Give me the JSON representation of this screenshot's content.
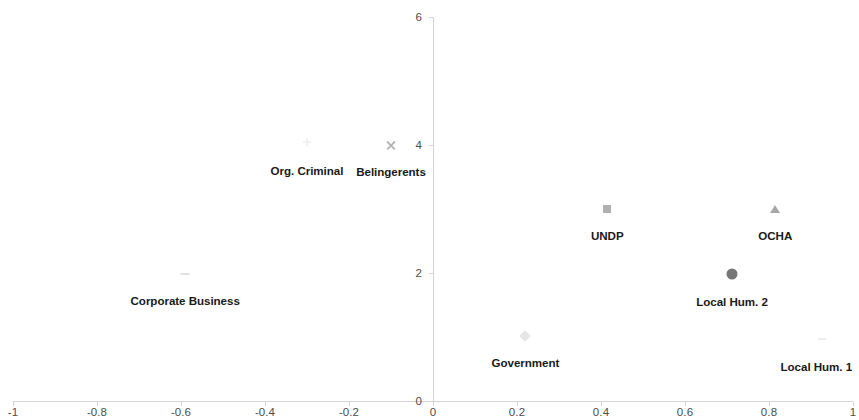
{
  "chart_data": {
    "type": "scatter",
    "title": "",
    "xlabel": "",
    "ylabel": "",
    "xlim": [
      -1,
      1
    ],
    "ylim": [
      0,
      6
    ],
    "grid": false,
    "legend": "none",
    "xticks": [
      "-1",
      "-0.8",
      "-0.6",
      "-0.4",
      "-0.2",
      "0",
      "0.2",
      "0.4",
      "0.6",
      "0.8",
      "1"
    ],
    "xtick_values": [
      -1,
      -0.8,
      -0.6,
      -0.4,
      -0.2,
      0,
      0.2,
      0.4,
      0.6,
      0.8,
      1
    ],
    "yticks": [
      "0",
      "2",
      "4",
      "6"
    ],
    "ytick_values": [
      0,
      2,
      4,
      6
    ],
    "axis_color": "#d4d4d4",
    "tick_label_color": "#4c4c4c",
    "point_label_color": "#1a1a1a",
    "points": [
      {
        "label": "Org. Criminal",
        "x": -0.3,
        "y": 4.05,
        "marker": "plus",
        "color": "#f2f2f2",
        "size": 8,
        "label_dx": 0,
        "label_dy": 22
      },
      {
        "label": "Belingerents",
        "x": -0.1,
        "y": 4.0,
        "marker": "x",
        "color": "#b5b5b5",
        "size": 11,
        "label_dx": 0,
        "label_dy": 20
      },
      {
        "label": "Corporate Business",
        "x": -0.59,
        "y": 1.98,
        "marker": "dash",
        "color": "#e0e0e0",
        "size": 9,
        "label_dx": 0,
        "label_dy": 20
      },
      {
        "label": "Government",
        "x": 0.22,
        "y": 1.02,
        "marker": "diamond",
        "color": "#e6e6e6",
        "size": 8,
        "label_dx": 0,
        "label_dy": 20
      },
      {
        "label": "UNDP",
        "x": 0.415,
        "y": 3.0,
        "marker": "square",
        "color": "#b0b0b0",
        "size": 8,
        "label_dx": 0,
        "label_dy": 20
      },
      {
        "label": "Local Hum. 2",
        "x": 0.712,
        "y": 1.98,
        "marker": "circle",
        "color": "#767676",
        "size": 11,
        "label_dx": 0,
        "label_dy": 21
      },
      {
        "label": "OCHA",
        "x": 0.815,
        "y": 3.0,
        "marker": "triangle",
        "color": "#a8a8a8",
        "size": 10,
        "label_dx": 0,
        "label_dy": 20
      },
      {
        "label": "Local Hum. 1",
        "x": 0.927,
        "y": 0.97,
        "marker": "dash",
        "color": "#ededed",
        "size": 8,
        "label_dx": -6,
        "label_dy": 21
      }
    ]
  },
  "geometry": {
    "x_axis_px": {
      "left": 13,
      "right": 853,
      "y": 401
    },
    "y_axis_px": {
      "x": 433,
      "top": 17,
      "bottom": 401
    }
  }
}
